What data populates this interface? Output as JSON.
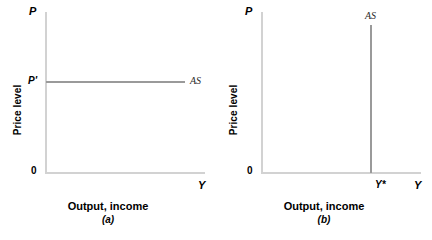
{
  "figure": {
    "type": "economics-diagram"
  },
  "panels": [
    {
      "id": "a",
      "index_label": "(a)",
      "x_axis": {
        "title": "Output, income",
        "endpoint_label": "Y",
        "tick_labels": []
      },
      "y_axis": {
        "title": "Price level",
        "endpoint_label": "P",
        "tick_labels": [
          "P'"
        ]
      },
      "origin_label": "0",
      "curve": {
        "name": "AS",
        "label": "AS",
        "orientation": "horizontal"
      }
    },
    {
      "id": "b",
      "index_label": "(b)",
      "x_axis": {
        "title": "Output, income",
        "endpoint_label": "Y",
        "tick_labels": [
          "Y*"
        ]
      },
      "y_axis": {
        "title": "Price level",
        "endpoint_label": "P",
        "tick_labels": []
      },
      "origin_label": "0",
      "curve": {
        "name": "AS",
        "label": "AS",
        "orientation": "vertical"
      }
    }
  ],
  "colors": {
    "curve": "#9a9a9a",
    "axis": "#d2d2d2",
    "text": "#000000",
    "curve_label_text": "#2b2b2b",
    "background": "#ffffff"
  },
  "chart_data": {
    "type": "line",
    "title": "",
    "subtitle": "",
    "panels": [
      {
        "id": "a",
        "caption": "(a)",
        "xlabel": "Output, income",
        "ylabel": "Price level",
        "x_endpoint_label": "Y",
        "y_endpoint_label": "P",
        "origin_label": "0",
        "grid": false,
        "legend": "inline-right",
        "xlim": [
          0,
          1
        ],
        "ylim": [
          0,
          1
        ],
        "xticks": [],
        "xticklabels": [],
        "yticks": [
          0.565
        ],
        "yticklabels": [
          "P'"
        ],
        "series": [
          {
            "name": "AS",
            "label": "AS",
            "orientation": "horizontal",
            "x": [
              0.0,
              0.875
            ],
            "y": [
              0.565,
              0.565
            ]
          }
        ]
      },
      {
        "id": "b",
        "caption": "(b)",
        "xlabel": "Output, income",
        "ylabel": "Price level",
        "x_endpoint_label": "Y",
        "y_endpoint_label": "P",
        "origin_label": "0",
        "grid": false,
        "legend": "inline-top",
        "xlim": [
          0,
          1
        ],
        "ylim": [
          0,
          1
        ],
        "xticks": [
          0.685
        ],
        "xticklabels": [
          "Y*"
        ],
        "yticks": [],
        "yticklabels": [],
        "series": [
          {
            "name": "AS",
            "label": "AS",
            "orientation": "vertical",
            "x": [
              0.685,
              0.685
            ],
            "y": [
              0.0,
              0.92
            ]
          }
        ]
      }
    ]
  }
}
